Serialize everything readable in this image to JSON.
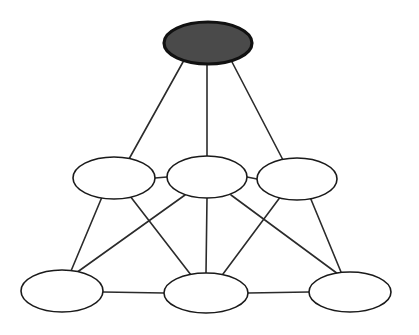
{
  "diagram": {
    "type": "node-link-graph",
    "canvas": {
      "width": 419,
      "height": 335,
      "background": "#ffffff"
    },
    "styles": {
      "edge_color": "#2b2b2b",
      "edge_width": 1.6,
      "node_stroke": "#1a1a1a",
      "node_open_fill": "#ffffff",
      "node_filled_fill": "#4a4a4a",
      "node_filled_stroke": "#111111"
    },
    "nodes": [
      {
        "id": "top",
        "label": "",
        "cx": 208,
        "cy": 43,
        "rx": 44,
        "ry": 21,
        "fill": "filled",
        "row": "top"
      },
      {
        "id": "mid-left",
        "label": "",
        "cx": 114,
        "cy": 178,
        "rx": 41,
        "ry": 21,
        "fill": "open",
        "row": "middle"
      },
      {
        "id": "mid-center",
        "label": "",
        "cx": 207,
        "cy": 177,
        "rx": 40,
        "ry": 21,
        "fill": "open",
        "row": "middle"
      },
      {
        "id": "mid-right",
        "label": "",
        "cx": 297,
        "cy": 179,
        "rx": 40,
        "ry": 21,
        "fill": "open",
        "row": "middle"
      },
      {
        "id": "bottom-left",
        "label": "",
        "cx": 62,
        "cy": 291,
        "rx": 41,
        "ry": 21,
        "fill": "open",
        "row": "bottom"
      },
      {
        "id": "bottom-center",
        "label": "",
        "cx": 206,
        "cy": 293,
        "rx": 42,
        "ry": 20,
        "fill": "open",
        "row": "bottom"
      },
      {
        "id": "bottom-right",
        "label": "",
        "cx": 350,
        "cy": 292,
        "rx": 41,
        "ry": 20,
        "fill": "open",
        "row": "bottom"
      }
    ],
    "edges": [
      {
        "id": "e1",
        "from": "top",
        "to": "mid-left",
        "x1": 183,
        "y1": 62,
        "x2": 129,
        "y2": 159
      },
      {
        "id": "e2",
        "from": "top",
        "to": "mid-center",
        "x1": 207,
        "y1": 64,
        "x2": 207,
        "y2": 156
      },
      {
        "id": "e3",
        "from": "top",
        "to": "mid-right",
        "x1": 232,
        "y1": 62,
        "x2": 283,
        "y2": 160
      },
      {
        "id": "e4",
        "from": "mid-left",
        "to": "mid-center",
        "x1": 155,
        "y1": 178,
        "x2": 167,
        "y2": 177
      },
      {
        "id": "e5",
        "from": "mid-center",
        "to": "mid-right",
        "x1": 247,
        "y1": 177,
        "x2": 257,
        "y2": 179
      },
      {
        "id": "e6",
        "from": "mid-left",
        "to": "bottom-left",
        "x1": 102,
        "y1": 197,
        "x2": 71,
        "y2": 271
      },
      {
        "id": "e7",
        "from": "mid-left",
        "to": "bottom-center",
        "x1": 130,
        "y1": 196,
        "x2": 191,
        "y2": 275
      },
      {
        "id": "e8",
        "from": "mid-center",
        "to": "bottom-left",
        "x1": 185,
        "y1": 195,
        "x2": 76,
        "y2": 273
      },
      {
        "id": "e9",
        "from": "mid-center",
        "to": "bottom-center",
        "x1": 207,
        "y1": 198,
        "x2": 206,
        "y2": 273
      },
      {
        "id": "e10",
        "from": "mid-center",
        "to": "bottom-right",
        "x1": 231,
        "y1": 195,
        "x2": 338,
        "y2": 274
      },
      {
        "id": "e11",
        "from": "mid-right",
        "to": "bottom-center",
        "x1": 281,
        "y1": 196,
        "x2": 223,
        "y2": 274
      },
      {
        "id": "e12",
        "from": "mid-right",
        "to": "bottom-right",
        "x1": 310,
        "y1": 197,
        "x2": 341,
        "y2": 272
      },
      {
        "id": "e13",
        "from": "bottom-left",
        "to": "bottom-center",
        "x1": 103,
        "y1": 292,
        "x2": 164,
        "y2": 293
      },
      {
        "id": "e14",
        "from": "bottom-center",
        "to": "bottom-right",
        "x1": 248,
        "y1": 293,
        "x2": 309,
        "y2": 292
      }
    ]
  }
}
